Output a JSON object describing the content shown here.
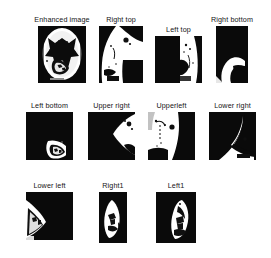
{
  "figure": {
    "type": "image-grid",
    "background_color": "#ffffff",
    "image_background_color": "#050505",
    "image_foreground_color": "#ffffff",
    "label_color": "#141414",
    "rows": [
      {
        "panels": [
          {
            "label": "Enhanced image",
            "x": 38,
            "y": 26,
            "width": 48,
            "height": 57,
            "variant": "enhanced"
          },
          {
            "label": "Right top",
            "x": 99,
            "y": 26,
            "width": 44,
            "height": 57,
            "variant": "right-top"
          },
          {
            "label": "Left top",
            "x": 155,
            "y": 36,
            "width": 47,
            "height": 47,
            "variant": "left-top"
          },
          {
            "label": "Right bottom",
            "x": 216,
            "y": 26,
            "width": 32,
            "height": 57,
            "variant": "right-bottom"
          }
        ]
      },
      {
        "panels": [
          {
            "label": "Left bottom",
            "x": 26,
            "y": 112,
            "width": 47,
            "height": 48,
            "variant": "left-bottom"
          },
          {
            "label": "Upper  right",
            "x": 88,
            "y": 112,
            "width": 47,
            "height": 48,
            "variant": "upper-right"
          },
          {
            "label": "Upperleft",
            "x": 148,
            "y": 112,
            "width": 47,
            "height": 48,
            "variant": "upper-left"
          },
          {
            "label": "Lower right",
            "x": 209,
            "y": 112,
            "width": 47,
            "height": 48,
            "variant": "lower-right"
          }
        ]
      },
      {
        "panels": [
          {
            "label": "Lower left",
            "x": 26,
            "y": 192,
            "width": 47,
            "height": 48,
            "variant": "lower-left"
          },
          {
            "label": "Right1",
            "x": 99,
            "y": 192,
            "width": 28,
            "height": 51,
            "variant": "right1"
          },
          {
            "label": "Left1",
            "x": 156,
            "y": 192,
            "width": 40,
            "height": 51,
            "variant": "left1"
          }
        ]
      }
    ]
  }
}
